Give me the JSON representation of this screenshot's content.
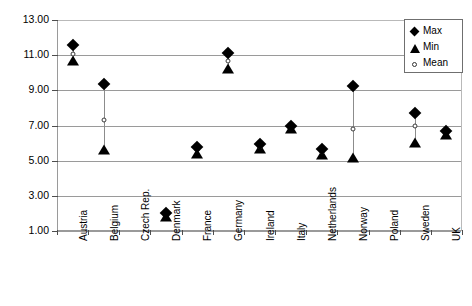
{
  "chart_data": {
    "type": "scatter",
    "title": "",
    "xlabel": "",
    "ylabel": "Cost per DDD in euros",
    "ylim": [
      1.0,
      13.0
    ],
    "ytick_step": 2.0,
    "ytick_labels": [
      "13.00",
      "11.00",
      "9.00",
      "7.00",
      "5.00",
      "3.00",
      "1.00"
    ],
    "ytick_values": [
      13.0,
      11.0,
      9.0,
      7.0,
      5.0,
      3.0,
      1.0
    ],
    "grid": true,
    "legend_position": "top-right",
    "legend": [
      {
        "label": "Max",
        "marker": "diamond"
      },
      {
        "label": "Min",
        "marker": "triangle"
      },
      {
        "label": "Mean",
        "marker": "open-circle"
      }
    ],
    "categories": [
      "Austria",
      "Belgium",
      "Czech Rep.",
      "Denmark",
      "France",
      "Germany",
      "Ireland",
      "Italy",
      "Netherlands",
      "Norway",
      "Poland",
      "Sweden",
      "UK"
    ],
    "series": [
      {
        "name": "Max",
        "values": [
          11.55,
          9.35,
          null,
          2.05,
          5.8,
          11.1,
          5.95,
          7.0,
          5.65,
          9.25,
          null,
          7.7,
          6.7
        ]
      },
      {
        "name": "Min",
        "values": [
          10.65,
          5.6,
          null,
          1.8,
          5.4,
          10.2,
          5.65,
          6.8,
          5.3,
          5.15,
          null,
          6.0,
          6.45
        ]
      },
      {
        "name": "Mean",
        "values": [
          11.05,
          7.3,
          null,
          1.95,
          5.6,
          10.65,
          5.8,
          6.9,
          5.5,
          6.8,
          null,
          7.0,
          6.55
        ]
      }
    ]
  }
}
